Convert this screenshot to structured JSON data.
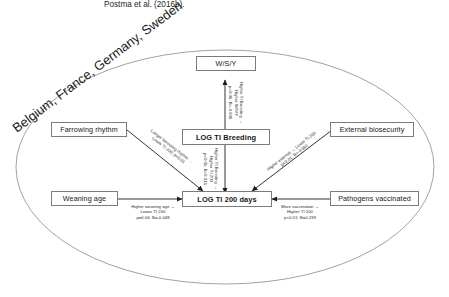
{
  "caption": {
    "text": "Postma et al. (2016b)."
  },
  "group": {
    "label": "Belgium, France, Germany, Sweden"
  },
  "nodes": {
    "wsy": {
      "label": "W/S/Y"
    },
    "ti_breeding": {
      "label": "LOG TI Breeding"
    },
    "ti_200": {
      "label": "LOG TI 200 days"
    },
    "farrowing": {
      "label": "Farrowing rhythm"
    },
    "weaning": {
      "label": "Weaning age"
    },
    "biosecurity": {
      "label": "External biosecurity"
    },
    "vaccinated": {
      "label": "Pathogens vaccinated"
    }
  },
  "edges": {
    "breeding_to_wsy": {
      "line1": "Higher TI Breeding →",
      "line2": "Higher W/S/Y",
      "line3": "p=0.06; B=-0.006"
    },
    "breeding_to_ti200": {
      "line1": "Higher TI Breeding →",
      "line2": "Higher TI 200",
      "line3": "p<0.01; B=0.316"
    },
    "farrowing_to_ti200": {
      "line1": "Longer farrowing rhythm →",
      "line2": "Lower TI 200; p<0.01"
    },
    "weaning_to_ti200": {
      "line1": "Higher weaning age →",
      "line2": "Lower TI 200",
      "line3": "p=0.06; B=-0.048"
    },
    "biosecurity_to_ti200": {
      "line1": "Higher external → Lower TI 200",
      "line2": "p<0.01; B=-0.082"
    },
    "vaccinated_to_ti200": {
      "line1": "More vaccination →",
      "line2": "Higher TI 200",
      "line3": "p<0.01; B=0.239"
    }
  },
  "colors": {
    "stroke": "#7b7b7b",
    "arrow": "#1d1d1d",
    "text": "#1b1b1b"
  }
}
